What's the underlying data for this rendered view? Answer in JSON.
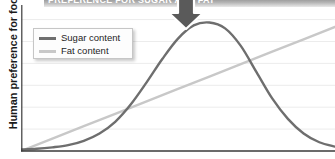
{
  "figure": {
    "banner_text": "PREFERENCE FOR SUGAR AND FAT",
    "arrow_icon": "arrow-down-icon"
  },
  "chart_data": {
    "type": "line",
    "title": "",
    "xlabel": "",
    "ylabel": "Human preference for food",
    "xlim": [
      0,
      100
    ],
    "ylim": [
      0,
      100
    ],
    "grid": true,
    "gridlines_y": [
      15,
      30,
      45,
      60,
      75,
      90
    ],
    "xticks": [],
    "yticks": [],
    "xtick_labels": [],
    "ytick_labels": [],
    "legend_position": "upper-left",
    "colors": {
      "sugar": "#6e6e6e",
      "fat": "#c8c8c8",
      "axis": "#3a3a3a",
      "grid": "#ececec"
    },
    "series": [
      {
        "name": "Sugar content",
        "color": "#6e6e6e",
        "shape": "gaussian-bell",
        "x": [
          0,
          5,
          10,
          15,
          20,
          25,
          30,
          35,
          40,
          45,
          50,
          55,
          60,
          65,
          70,
          75,
          80,
          85,
          90,
          95,
          100
        ],
        "values": [
          1,
          1.5,
          2.5,
          4,
          7,
          12,
          20,
          32,
          47,
          63,
          77,
          86,
          88,
          84,
          72,
          54,
          36,
          22,
          12,
          6,
          3
        ]
      },
      {
        "name": "Fat content",
        "color": "#c8c8c8",
        "shape": "linear",
        "x": [
          0,
          10,
          20,
          30,
          40,
          50,
          60,
          70,
          80,
          90,
          100
        ],
        "values": [
          0,
          8.5,
          17,
          25.5,
          34,
          42.5,
          51,
          59.5,
          68,
          76.5,
          85
        ]
      }
    ]
  }
}
